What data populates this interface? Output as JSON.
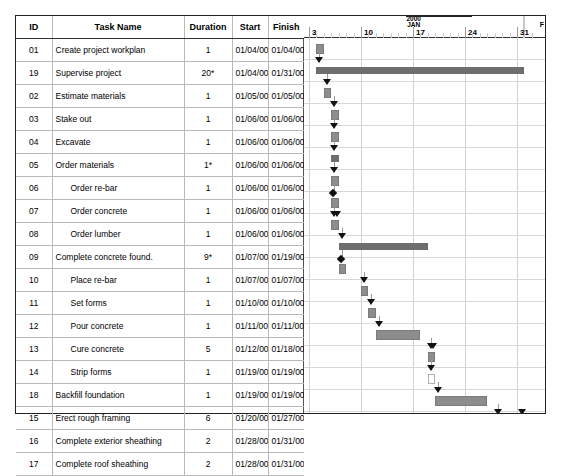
{
  "header": {
    "columns": [
      "ID",
      "Task Name",
      "Duration",
      "Start",
      "Finish"
    ]
  },
  "timeline": {
    "year_label": "2000",
    "month_label": "JAN",
    "next_month_label": "F",
    "ticks": [
      "3",
      "10",
      "17",
      "24",
      "31"
    ]
  },
  "rows": [
    {
      "id": "01",
      "name": "Create project workplan",
      "indent": 0,
      "duration": "1",
      "start": "01/04/00",
      "finish": "01/04/00",
      "type": "task"
    },
    {
      "id": "19",
      "name": "Supervise project",
      "indent": 0,
      "duration": "20*",
      "start": "01/04/00",
      "finish": "01/31/00",
      "type": "summary"
    },
    {
      "id": "02",
      "name": "Estimate materials",
      "indent": 0,
      "duration": "1",
      "start": "01/05/00",
      "finish": "01/05/00",
      "type": "task"
    },
    {
      "id": "03",
      "name": "Stake out",
      "indent": 0,
      "duration": "1",
      "start": "01/06/00",
      "finish": "01/06/00",
      "type": "task"
    },
    {
      "id": "04",
      "name": "Excavate",
      "indent": 0,
      "duration": "1",
      "start": "01/06/00",
      "finish": "01/06/00",
      "type": "task"
    },
    {
      "id": "05",
      "name": "Order materials",
      "indent": 0,
      "duration": "1*",
      "start": "01/06/00",
      "finish": "01/06/00",
      "type": "summary"
    },
    {
      "id": "06",
      "name": "Order re-bar",
      "indent": 1,
      "duration": "1",
      "start": "01/06/00",
      "finish": "01/06/00",
      "type": "task"
    },
    {
      "id": "07",
      "name": "Order concrete",
      "indent": 1,
      "duration": "1",
      "start": "01/06/00",
      "finish": "01/06/00",
      "type": "task"
    },
    {
      "id": "08",
      "name": "Order lumber",
      "indent": 1,
      "duration": "1",
      "start": "01/06/00",
      "finish": "01/06/00",
      "type": "task"
    },
    {
      "id": "09",
      "name": "Complete concrete found.",
      "indent": 0,
      "duration": "9*",
      "start": "01/07/00",
      "finish": "01/19/00",
      "type": "summary"
    },
    {
      "id": "10",
      "name": "Place re-bar",
      "indent": 1,
      "duration": "1",
      "start": "01/07/00",
      "finish": "01/07/00",
      "type": "task"
    },
    {
      "id": "11",
      "name": "Set forms",
      "indent": 1,
      "duration": "1",
      "start": "01/10/00",
      "finish": "01/10/00",
      "type": "task"
    },
    {
      "id": "12",
      "name": "Pour concrete",
      "indent": 1,
      "duration": "1",
      "start": "01/11/00",
      "finish": "01/11/00",
      "type": "task"
    },
    {
      "id": "13",
      "name": "Cure concrete",
      "indent": 1,
      "duration": "5",
      "start": "01/12/00",
      "finish": "01/18/00",
      "type": "task"
    },
    {
      "id": "14",
      "name": "Strip forms",
      "indent": 1,
      "duration": "1",
      "start": "01/19/00",
      "finish": "01/19/00",
      "type": "task"
    },
    {
      "id": "18",
      "name": "Backfill foundation",
      "indent": 0,
      "duration": "1",
      "start": "01/19/00",
      "finish": "01/19/00",
      "type": "open"
    },
    {
      "id": "15",
      "name": "Erect rough framing",
      "indent": 0,
      "duration": "6",
      "start": "01/20/00",
      "finish": "01/27/00",
      "type": "task"
    },
    {
      "id": "16",
      "name": "Complete exterior sheathing",
      "indent": 0,
      "duration": "2",
      "start": "01/28/00",
      "finish": "01/31/00",
      "type": "task"
    },
    {
      "id": "17",
      "name": "Complete roof sheathing",
      "indent": 0,
      "duration": "2",
      "start": "01/28/00",
      "finish": "01/31/00",
      "type": "task"
    }
  ],
  "chart_data": {
    "type": "bar",
    "xlabel": "",
    "ylabel": "",
    "axis_start_date": "01/03/00",
    "axis_end_date": "02/02/00",
    "day_width_px": 7.43,
    "bars": [
      {
        "id": "01",
        "label": "Create project workplan",
        "start_day": 1,
        "end_day": 2,
        "kind": "task"
      },
      {
        "id": "19",
        "label": "Supervise project",
        "start_day": 1,
        "end_day": 29,
        "kind": "summary"
      },
      {
        "id": "02",
        "label": "Estimate materials",
        "start_day": 2,
        "end_day": 3,
        "kind": "task"
      },
      {
        "id": "03",
        "label": "Stake out",
        "start_day": 3,
        "end_day": 4,
        "kind": "task"
      },
      {
        "id": "04",
        "label": "Excavate",
        "start_day": 3,
        "end_day": 4,
        "kind": "task"
      },
      {
        "id": "05",
        "label": "Order materials",
        "start_day": 3,
        "end_day": 4,
        "kind": "summary"
      },
      {
        "id": "06",
        "label": "Order re-bar",
        "start_day": 3,
        "end_day": 4,
        "kind": "task"
      },
      {
        "id": "07",
        "label": "Order concrete",
        "start_day": 3,
        "end_day": 4,
        "kind": "task"
      },
      {
        "id": "08",
        "label": "Order lumber",
        "start_day": 3,
        "end_day": 4,
        "kind": "task"
      },
      {
        "id": "09",
        "label": "Complete concrete found.",
        "start_day": 4,
        "end_day": 16,
        "kind": "summary"
      },
      {
        "id": "10",
        "label": "Place re-bar",
        "start_day": 4,
        "end_day": 5,
        "kind": "task"
      },
      {
        "id": "11",
        "label": "Set forms",
        "start_day": 7,
        "end_day": 8,
        "kind": "task"
      },
      {
        "id": "12",
        "label": "Pour concrete",
        "start_day": 8,
        "end_day": 9,
        "kind": "task"
      },
      {
        "id": "13",
        "label": "Cure concrete",
        "start_day": 9,
        "end_day": 15,
        "kind": "task"
      },
      {
        "id": "14",
        "label": "Strip forms",
        "start_day": 16,
        "end_day": 17,
        "kind": "task"
      },
      {
        "id": "18",
        "label": "Backfill foundation",
        "start_day": 16,
        "end_day": 17,
        "kind": "open"
      },
      {
        "id": "15",
        "label": "Erect rough framing",
        "start_day": 17,
        "end_day": 24,
        "kind": "task"
      },
      {
        "id": "16",
        "label": "Complete exterior sheathing",
        "start_day": 25,
        "end_day": 29,
        "kind": "task"
      },
      {
        "id": "17",
        "label": "Complete roof sheathing",
        "start_day": 25,
        "end_day": 29,
        "kind": "task"
      }
    ]
  },
  "colors": {
    "task_bar": "#8d8d8d",
    "summary_bar": "#6e6e6e",
    "grid_line": "#d2d2d2",
    "border": "#222222"
  }
}
